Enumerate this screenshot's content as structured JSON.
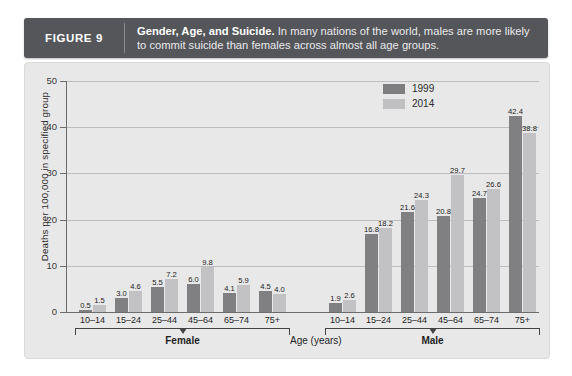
{
  "figure": {
    "number_label": "FIGURE 9",
    "title": "Gender, Age, and Suicide.",
    "description": "In many nations of the world, males are more likely to commit suicide than females across almost all age groups."
  },
  "legend": {
    "items": [
      {
        "label": "1999",
        "color": "#808083"
      },
      {
        "label": "2014",
        "color": "#c2c2c4"
      }
    ]
  },
  "axis": {
    "y_title": "Deaths per 100,000 in specified group",
    "y_ticks": [
      "0",
      "10",
      "20",
      "30",
      "40",
      "50"
    ],
    "x_title": "Age (years)",
    "group_female": "Female",
    "group_male": "Male"
  },
  "chart_data": {
    "type": "bar",
    "title": "Gender, Age, and Suicide",
    "xlabel": "Age (years)",
    "ylabel": "Deaths per 100,000 in specified group",
    "ylim": [
      0,
      50
    ],
    "ytick_step": 10,
    "grid": true,
    "legend_position": "top-right",
    "groups": [
      "Female",
      "Male"
    ],
    "categories": [
      "10–14",
      "15–24",
      "25–44",
      "45–64",
      "65–74",
      "75+"
    ],
    "series": [
      {
        "name": "1999",
        "color": "#808083",
        "Female": [
          0.5,
          3.0,
          5.5,
          6.0,
          4.1,
          4.5
        ],
        "Male": [
          1.9,
          16.8,
          21.6,
          20.8,
          24.7,
          42.4
        ]
      },
      {
        "name": "2014",
        "color": "#c2c2c4",
        "Female": [
          1.5,
          4.6,
          7.2,
          9.8,
          5.9,
          4.0
        ],
        "Male": [
          2.6,
          18.2,
          24.3,
          29.7,
          26.6,
          38.8
        ]
      }
    ],
    "bars": [
      {
        "sex": "Female",
        "age": "10–14",
        "year": "1999",
        "value": 0.5
      },
      {
        "sex": "Female",
        "age": "10–14",
        "year": "2014",
        "value": 1.5
      },
      {
        "sex": "Female",
        "age": "15–24",
        "year": "1999",
        "value": 3.0
      },
      {
        "sex": "Female",
        "age": "15–24",
        "year": "2014",
        "value": 4.6
      },
      {
        "sex": "Female",
        "age": "25–44",
        "year": "1999",
        "value": 5.5
      },
      {
        "sex": "Female",
        "age": "25–44",
        "year": "2014",
        "value": 7.2
      },
      {
        "sex": "Female",
        "age": "45–64",
        "year": "1999",
        "value": 6.0
      },
      {
        "sex": "Female",
        "age": "45–64",
        "year": "2014",
        "value": 9.8
      },
      {
        "sex": "Female",
        "age": "65–74",
        "year": "1999",
        "value": 4.1
      },
      {
        "sex": "Female",
        "age": "65–74",
        "year": "2014",
        "value": 5.9
      },
      {
        "sex": "Female",
        "age": "75+",
        "year": "1999",
        "value": 4.5
      },
      {
        "sex": "Female",
        "age": "75+",
        "year": "2014",
        "value": 4.0
      },
      {
        "sex": "Male",
        "age": "10–14",
        "year": "1999",
        "value": 1.9
      },
      {
        "sex": "Male",
        "age": "10–14",
        "year": "2014",
        "value": 2.6
      },
      {
        "sex": "Male",
        "age": "15–24",
        "year": "1999",
        "value": 16.8
      },
      {
        "sex": "Male",
        "age": "15–24",
        "year": "2014",
        "value": 18.2
      },
      {
        "sex": "Male",
        "age": "25–44",
        "year": "1999",
        "value": 21.6
      },
      {
        "sex": "Male",
        "age": "25–44",
        "year": "2014",
        "value": 24.3
      },
      {
        "sex": "Male",
        "age": "45–64",
        "year": "1999",
        "value": 20.8
      },
      {
        "sex": "Male",
        "age": "45–64",
        "year": "2014",
        "value": 29.7
      },
      {
        "sex": "Male",
        "age": "65–74",
        "year": "1999",
        "value": 24.7
      },
      {
        "sex": "Male",
        "age": "65–74",
        "year": "2014",
        "value": 26.6
      },
      {
        "sex": "Male",
        "age": "75+",
        "year": "1999",
        "value": 42.4
      },
      {
        "sex": "Male",
        "age": "75+",
        "year": "2014",
        "value": 38.8
      }
    ]
  }
}
